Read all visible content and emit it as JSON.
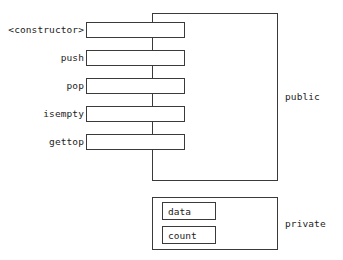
{
  "diagram": {
    "line_color": "#3a3a3a",
    "text_color": "#1c1c1c",
    "background": "#ffffff"
  },
  "public_section": {
    "caption": "public",
    "methods": [
      {
        "label": "<constructor>"
      },
      {
        "label": "push"
      },
      {
        "label": "pop"
      },
      {
        "label": "isempty"
      },
      {
        "label": "gettop"
      }
    ]
  },
  "private_section": {
    "caption": "private",
    "fields": [
      {
        "label": "data"
      },
      {
        "label": "count"
      }
    ]
  }
}
